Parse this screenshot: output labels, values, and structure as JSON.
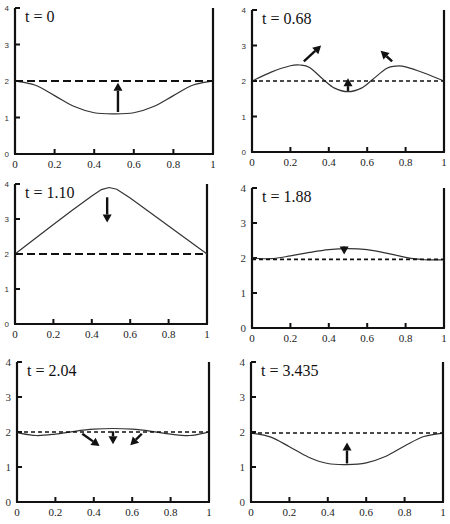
{
  "chart_data": [
    {
      "type": "line",
      "title": "t = 0",
      "xlabel": "",
      "ylabel": "",
      "xlim": [
        0,
        1
      ],
      "ylim": [
        0,
        4
      ],
      "xticks": [
        "0",
        "0.2",
        "0.4",
        "0.6",
        "0.8",
        "1"
      ],
      "yticks": [
        "0",
        "1",
        "2",
        "3",
        "4"
      ],
      "grid": false,
      "series": [
        {
          "name": "profile",
          "style": "solid",
          "x": [
            0,
            0.1,
            0.2,
            0.3,
            0.4,
            0.5,
            0.6,
            0.7,
            0.8,
            0.9,
            1
          ],
          "values": [
            2.0,
            1.89,
            1.6,
            1.3,
            1.13,
            1.1,
            1.13,
            1.3,
            1.6,
            1.89,
            2.0
          ]
        },
        {
          "name": "equilibrium",
          "style": "dashed",
          "x": [
            0,
            1
          ],
          "values": [
            2.0,
            2.0
          ]
        }
      ],
      "annotations": [
        {
          "type": "arrow",
          "from": [
            0.52,
            1.15
          ],
          "to": [
            0.52,
            1.95
          ],
          "direction": "up"
        }
      ]
    },
    {
      "type": "line",
      "title": "t = 0.68",
      "xlabel": "",
      "ylabel": "",
      "xlim": [
        0,
        1
      ],
      "ylim": [
        0,
        4
      ],
      "xticks": [
        "0",
        "0.2",
        "0.4",
        "0.6",
        "0.8",
        "1"
      ],
      "yticks": [
        "0",
        "1",
        "2",
        "3",
        "4"
      ],
      "grid": false,
      "series": [
        {
          "name": "profile",
          "style": "solid",
          "x": [
            0,
            0.1,
            0.2,
            0.25,
            0.3,
            0.37,
            0.43,
            0.5,
            0.57,
            0.63,
            0.7,
            0.75,
            0.8,
            0.9,
            1
          ],
          "values": [
            2.0,
            2.25,
            2.43,
            2.45,
            2.38,
            2.05,
            1.8,
            1.7,
            1.8,
            2.05,
            2.35,
            2.42,
            2.4,
            2.22,
            2.0
          ]
        },
        {
          "name": "equilibrium",
          "style": "dashed",
          "x": [
            0,
            1
          ],
          "values": [
            2.0,
            2.0
          ]
        }
      ],
      "annotations": [
        {
          "type": "arrow",
          "from": [
            0.27,
            2.55
          ],
          "to": [
            0.36,
            3.0
          ],
          "direction": "up-right"
        },
        {
          "type": "arrow",
          "from": [
            0.73,
            2.55
          ],
          "to": [
            0.67,
            2.85
          ],
          "direction": "up-left"
        },
        {
          "type": "arrow",
          "from": [
            0.5,
            1.72
          ],
          "to": [
            0.5,
            2.08
          ],
          "direction": "up"
        }
      ]
    },
    {
      "type": "line",
      "title": "t = 1.10",
      "xlabel": "",
      "ylabel": "",
      "xlim": [
        0,
        1
      ],
      "ylim": [
        0,
        4
      ],
      "xticks": [
        "0",
        "0.2",
        "0.4",
        "0.6",
        "0.8",
        "1"
      ],
      "yticks": [
        "0",
        "1",
        "2",
        "3",
        "4"
      ],
      "grid": false,
      "series": [
        {
          "name": "profile",
          "style": "solid",
          "x": [
            0,
            0.1,
            0.2,
            0.3,
            0.4,
            0.45,
            0.49,
            0.53,
            0.6,
            0.7,
            0.8,
            0.9,
            1
          ],
          "values": [
            2.0,
            2.42,
            2.84,
            3.26,
            3.66,
            3.84,
            3.9,
            3.85,
            3.6,
            3.2,
            2.8,
            2.4,
            2.0
          ]
        },
        {
          "name": "equilibrium",
          "style": "dashed",
          "x": [
            0,
            1
          ],
          "values": [
            2.0,
            2.0
          ]
        }
      ],
      "annotations": [
        {
          "type": "arrow",
          "from": [
            0.48,
            3.62
          ],
          "to": [
            0.48,
            2.9
          ],
          "direction": "down"
        }
      ]
    },
    {
      "type": "line",
      "title": "t = 1.88",
      "xlabel": "",
      "ylabel": "",
      "xlim": [
        0,
        1
      ],
      "ylim": [
        0,
        4
      ],
      "xticks": [
        "0",
        "0.2",
        "0.4",
        "0.6",
        "0.8",
        "1"
      ],
      "yticks": [
        "0",
        "1",
        "2",
        "3",
        "4"
      ],
      "grid": false,
      "series": [
        {
          "name": "profile",
          "style": "solid",
          "x": [
            0,
            0.1,
            0.2,
            0.3,
            0.4,
            0.5,
            0.6,
            0.7,
            0.8,
            0.9,
            1
          ],
          "values": [
            2.0,
            1.98,
            2.06,
            2.16,
            2.24,
            2.27,
            2.24,
            2.14,
            2.02,
            1.95,
            1.95
          ]
        },
        {
          "name": "equilibrium",
          "style": "dashed",
          "x": [
            0,
            1
          ],
          "values": [
            1.96,
            1.96
          ]
        }
      ],
      "annotations": [
        {
          "type": "arrow",
          "from": [
            0.48,
            2.28
          ],
          "to": [
            0.48,
            2.1
          ],
          "direction": "down"
        }
      ]
    },
    {
      "type": "line",
      "title": "t = 2.04",
      "xlabel": "",
      "ylabel": "",
      "xlim": [
        0,
        1
      ],
      "ylim": [
        0,
        4
      ],
      "xticks": [
        "0",
        "0.2",
        "0.4",
        "0.6",
        "0.8",
        "1"
      ],
      "yticks": [
        "0",
        "1",
        "2",
        "3",
        "4"
      ],
      "grid": false,
      "series": [
        {
          "name": "profile",
          "style": "solid",
          "x": [
            0,
            0.1,
            0.2,
            0.3,
            0.4,
            0.5,
            0.6,
            0.7,
            0.8,
            0.9,
            1
          ],
          "values": [
            1.98,
            1.9,
            1.94,
            2.02,
            2.08,
            2.1,
            2.08,
            2.02,
            1.94,
            1.9,
            2.0
          ]
        },
        {
          "name": "equilibrium",
          "style": "dashed",
          "x": [
            0,
            1
          ],
          "values": [
            2.0,
            2.0
          ]
        }
      ],
      "annotations": [
        {
          "type": "arrow",
          "from": [
            0.34,
            1.95
          ],
          "to": [
            0.43,
            1.6
          ],
          "direction": "down-right"
        },
        {
          "type": "arrow",
          "from": [
            0.5,
            2.02
          ],
          "to": [
            0.5,
            1.65
          ],
          "direction": "down"
        },
        {
          "type": "arrow",
          "from": [
            0.65,
            1.95
          ],
          "to": [
            0.59,
            1.62
          ],
          "direction": "down-left"
        }
      ]
    },
    {
      "type": "line",
      "title": "t = 3.435",
      "xlabel": "",
      "ylabel": "",
      "xlim": [
        0,
        1
      ],
      "ylim": [
        0,
        4
      ],
      "xticks": [
        "0",
        "0.2",
        "0.4",
        "0.6",
        "0.8",
        "1"
      ],
      "yticks": [
        "0",
        "1",
        "2",
        "3",
        "4"
      ],
      "grid": false,
      "series": [
        {
          "name": "profile",
          "style": "solid",
          "x": [
            0,
            0.1,
            0.2,
            0.3,
            0.4,
            0.5,
            0.6,
            0.7,
            0.8,
            0.9,
            1
          ],
          "values": [
            1.97,
            1.86,
            1.58,
            1.28,
            1.1,
            1.07,
            1.12,
            1.3,
            1.6,
            1.87,
            1.97
          ]
        },
        {
          "name": "equilibrium",
          "style": "dashed",
          "x": [
            0,
            1
          ],
          "values": [
            1.97,
            1.97
          ]
        }
      ],
      "annotations": [
        {
          "type": "arrow",
          "from": [
            0.5,
            1.1
          ],
          "to": [
            0.5,
            1.7
          ],
          "direction": "up"
        }
      ]
    }
  ],
  "layout": {
    "panels": [
      {
        "left": 15,
        "right": 213,
        "top": 8,
        "bottom": 154,
        "ytick_style": "small"
      },
      {
        "left": 252,
        "right": 444,
        "top": 10,
        "bottom": 152,
        "ytick_style": "small"
      },
      {
        "left": 15,
        "right": 207,
        "top": 184,
        "bottom": 324,
        "ytick_style": "small"
      },
      {
        "left": 252,
        "right": 444,
        "top": 188,
        "bottom": 328,
        "ytick_style": "big"
      },
      {
        "left": 17,
        "right": 209,
        "top": 362,
        "bottom": 502,
        "ytick_style": "big"
      },
      {
        "left": 251,
        "right": 443,
        "top": 362,
        "bottom": 502,
        "ytick_style": "big"
      }
    ],
    "line_color": "#111111",
    "curve_color": "#333333"
  }
}
